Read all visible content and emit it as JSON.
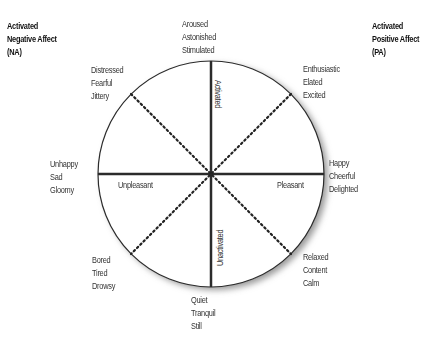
{
  "diagram": {
    "type": "circumplex-model-of-affect",
    "corners": {
      "top_left": [
        "Activated",
        "Negative Affect",
        "(NA)"
      ],
      "top_right": [
        "Activated",
        "Positive Affect",
        "(PA)"
      ]
    },
    "axes": {
      "vertical_top": "Activated",
      "vertical_bottom": "Unactivated",
      "horizontal_left": "Unpleasant",
      "horizontal_right": "Pleasant"
    },
    "octants": {
      "top": [
        "Aroused",
        "Astonished",
        "Stimulated"
      ],
      "top_right": [
        "Enthusiastic",
        "Elated",
        "Excited"
      ],
      "right": [
        "Happy",
        "Cheerful",
        "Delighted"
      ],
      "bottom_right": [
        "Relaxed",
        "Content",
        "Calm"
      ],
      "bottom": [
        "Quiet",
        "Tranquil",
        "Still"
      ],
      "bottom_left": [
        "Bored",
        "Tired",
        "Drowsy"
      ],
      "left": [
        "Unhappy",
        "Sad",
        "Gloomy"
      ],
      "top_left": [
        "Distressed",
        "Fearful",
        "Jittery"
      ]
    },
    "colors": {
      "line": "#2b2b2b",
      "shadow": "#999999",
      "text": "#333333"
    }
  }
}
